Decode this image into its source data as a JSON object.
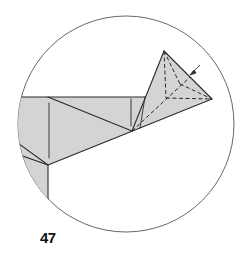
{
  "diagram": {
    "type": "origami-step-diagram",
    "step_number": "47",
    "colors": {
      "paper_fill": "#d4d4d4",
      "line": "#2a2a2a",
      "circle": "#555555",
      "background": "#ffffff"
    },
    "elements": [
      "circular-detail-frame",
      "shaded-model-body",
      "pointed-flap-with-dashed-hidden-lines",
      "small-arrow-pointing-at-flap"
    ]
  }
}
